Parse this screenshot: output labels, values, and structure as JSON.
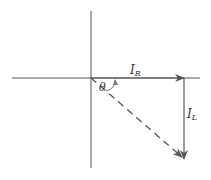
{
  "diagram": {
    "labels": {
      "ir": "I",
      "ir_sub": "R",
      "il": "I",
      "il_sub": "L",
      "theta": "θ"
    },
    "colors": {
      "axis": "#555555",
      "arrow": "#555555",
      "text": "#333333",
      "background": "#ffffff"
    },
    "elements": [
      {
        "name": "horizontal-axis",
        "type": "line"
      },
      {
        "name": "vertical-axis",
        "type": "line"
      },
      {
        "name": "ir-phasor",
        "type": "arrow",
        "direction": "right"
      },
      {
        "name": "il-phasor",
        "type": "arrow",
        "direction": "down"
      },
      {
        "name": "resultant-phasor",
        "type": "dashed-arrow",
        "direction": "down-right"
      },
      {
        "name": "theta-angle-arc",
        "type": "arc-arrow"
      }
    ]
  }
}
